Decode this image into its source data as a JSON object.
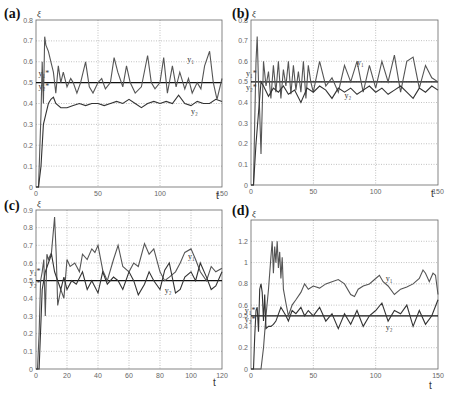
{
  "chart_data": [
    {
      "panel": "(a)",
      "type": "line",
      "title": "",
      "xlabel": "t",
      "ylabel": "ξ",
      "xlim": [
        0,
        150
      ],
      "ylim": [
        0,
        0.8
      ],
      "xticks": [
        "0",
        "50",
        "100",
        "150"
      ],
      "yticks": [
        "0",
        "0.1",
        "0.2",
        "0.3",
        "0.4",
        "0.5",
        "0.6",
        "0.7",
        "0.8"
      ],
      "grid": true,
      "reference_line": 0.5,
      "annotations": [
        "y1",
        "y2",
        "y1*",
        "y2*"
      ],
      "series": [
        {
          "name": "y1",
          "x": [
            0,
            2,
            4,
            5,
            6,
            7,
            8,
            10,
            12,
            14,
            16,
            18,
            20,
            22,
            25,
            28,
            30,
            33,
            36,
            40,
            43,
            46,
            50,
            53,
            56,
            60,
            63,
            66,
            70,
            73,
            76,
            80,
            85,
            90,
            93,
            96,
            100,
            103,
            106,
            110,
            113,
            116,
            120,
            123,
            126,
            130,
            133,
            136,
            140,
            143,
            146,
            150
          ],
          "values": [
            0,
            0,
            0.35,
            0.6,
            0.4,
            0.72,
            0.68,
            0.65,
            0.6,
            0.55,
            0.45,
            0.58,
            0.5,
            0.55,
            0.48,
            0.52,
            0.5,
            0.45,
            0.5,
            0.6,
            0.48,
            0.45,
            0.5,
            0.52,
            0.47,
            0.5,
            0.62,
            0.55,
            0.48,
            0.58,
            0.5,
            0.45,
            0.48,
            0.63,
            0.5,
            0.47,
            0.5,
            0.62,
            0.45,
            0.58,
            0.48,
            0.55,
            0.47,
            0.52,
            0.45,
            0.5,
            0.47,
            0.58,
            0.65,
            0.5,
            0.42,
            0.52
          ]
        },
        {
          "name": "y2",
          "x": [
            0,
            2,
            4,
            6,
            8,
            10,
            12,
            14,
            16,
            20,
            25,
            30,
            35,
            40,
            45,
            50,
            55,
            60,
            65,
            70,
            75,
            80,
            85,
            90,
            95,
            100,
            105,
            110,
            115,
            120,
            125,
            130,
            135,
            140,
            145,
            150
          ],
          "values": [
            0,
            0,
            0.1,
            0.3,
            0.35,
            0.4,
            0.42,
            0.43,
            0.4,
            0.38,
            0.38,
            0.39,
            0.4,
            0.39,
            0.4,
            0.4,
            0.39,
            0.4,
            0.41,
            0.4,
            0.42,
            0.4,
            0.38,
            0.4,
            0.41,
            0.4,
            0.41,
            0.4,
            0.44,
            0.4,
            0.39,
            0.41,
            0.4,
            0.4,
            0.42,
            0.41
          ]
        }
      ]
    },
    {
      "panel": "(b)",
      "type": "line",
      "title": "",
      "xlabel": "t",
      "ylabel": "ξ",
      "xlim": [
        0,
        150
      ],
      "ylim": [
        0,
        0.8
      ],
      "xticks": [
        "0",
        "50",
        "100",
        "150"
      ],
      "yticks": [
        "0",
        "0.1",
        "0.2",
        "0.3",
        "0.4",
        "0.5",
        "0.6",
        "0.7",
        "0.8"
      ],
      "grid": true,
      "reference_line": 0.5,
      "annotations": [
        "y1",
        "y2",
        "y1*",
        "y2*"
      ],
      "series": [
        {
          "name": "y1",
          "x": [
            0,
            2,
            3,
            4,
            5,
            6,
            7,
            8,
            10,
            12,
            14,
            16,
            18,
            20,
            22,
            24,
            26,
            28,
            30,
            32,
            34,
            36,
            38,
            40,
            42,
            44,
            46,
            48,
            50,
            55,
            60,
            65,
            70,
            75,
            80,
            85,
            90,
            95,
            100,
            105,
            110,
            115,
            120,
            125,
            130,
            135,
            140,
            145,
            150
          ],
          "values": [
            0,
            0,
            0.3,
            0.6,
            0.72,
            0.5,
            0.35,
            0.15,
            0.6,
            0.48,
            0.55,
            0.42,
            0.58,
            0.45,
            0.6,
            0.42,
            0.56,
            0.48,
            0.6,
            0.44,
            0.58,
            0.46,
            0.55,
            0.45,
            0.6,
            0.42,
            0.58,
            0.5,
            0.45,
            0.6,
            0.48,
            0.52,
            0.45,
            0.58,
            0.5,
            0.6,
            0.45,
            0.58,
            0.47,
            0.6,
            0.5,
            0.63,
            0.45,
            0.6,
            0.62,
            0.47,
            0.58,
            0.52,
            0.5
          ]
        },
        {
          "name": "y2",
          "x": [
            0,
            2,
            4,
            6,
            8,
            10,
            14,
            18,
            22,
            26,
            30,
            35,
            40,
            45,
            50,
            55,
            60,
            65,
            70,
            75,
            80,
            85,
            90,
            95,
            100,
            105,
            110,
            115,
            120,
            125,
            130,
            135,
            140,
            145,
            150
          ],
          "values": [
            0,
            0,
            0.2,
            0.35,
            0.5,
            0.48,
            0.43,
            0.47,
            0.45,
            0.48,
            0.44,
            0.46,
            0.4,
            0.47,
            0.45,
            0.48,
            0.46,
            0.42,
            0.47,
            0.45,
            0.47,
            0.44,
            0.46,
            0.48,
            0.45,
            0.47,
            0.44,
            0.46,
            0.48,
            0.45,
            0.42,
            0.47,
            0.45,
            0.48,
            0.46
          ]
        }
      ]
    },
    {
      "panel": "(c)",
      "type": "line",
      "title": "",
      "xlabel": "t",
      "ylabel": "ξ",
      "xlim": [
        0,
        120
      ],
      "ylim": [
        0,
        0.9
      ],
      "xticks": [
        "0",
        "20",
        "40",
        "60",
        "80",
        "100",
        "120"
      ],
      "yticks": [
        "0",
        "0.1",
        "0.2",
        "0.3",
        "0.4",
        "0.5",
        "0.6",
        "0.7",
        "0.8",
        "0.9"
      ],
      "grid": true,
      "reference_line": 0.5,
      "annotations": [
        "y1",
        "y2",
        "y1*",
        "y2*"
      ],
      "series": [
        {
          "name": "y1",
          "x": [
            0,
            1,
            2,
            3,
            4,
            5,
            6,
            7,
            8,
            10,
            12,
            13,
            14,
            16,
            18,
            20,
            22,
            25,
            28,
            30,
            33,
            36,
            38,
            40,
            43,
            46,
            50,
            53,
            56,
            60,
            63,
            66,
            70,
            73,
            76,
            80,
            83,
            86,
            90,
            93,
            96,
            100,
            103,
            106,
            110,
            113,
            116,
            120
          ],
          "values": [
            0,
            0,
            0.2,
            0.5,
            0.55,
            0.62,
            0.3,
            0.65,
            0.62,
            0.66,
            0.86,
            0.65,
            0.36,
            0.45,
            0.4,
            0.62,
            0.58,
            0.6,
            0.55,
            0.65,
            0.62,
            0.68,
            0.66,
            0.7,
            0.56,
            0.5,
            0.62,
            0.7,
            0.58,
            0.55,
            0.6,
            0.58,
            0.71,
            0.65,
            0.68,
            0.55,
            0.5,
            0.52,
            0.55,
            0.6,
            0.66,
            0.68,
            0.62,
            0.55,
            0.5,
            0.58,
            0.55,
            0.57
          ]
        },
        {
          "name": "y2",
          "x": [
            0,
            2,
            4,
            6,
            8,
            10,
            12,
            14,
            16,
            18,
            20,
            23,
            26,
            30,
            33,
            36,
            40,
            43,
            46,
            50,
            53,
            56,
            60,
            63,
            66,
            70,
            73,
            76,
            80,
            83,
            86,
            90,
            93,
            96,
            100,
            103,
            106,
            110,
            113,
            116,
            120
          ],
          "values": [
            0,
            0,
            0.45,
            0.55,
            0.6,
            0.65,
            0.55,
            0.5,
            0.45,
            0.52,
            0.45,
            0.5,
            0.48,
            0.55,
            0.45,
            0.5,
            0.43,
            0.55,
            0.48,
            0.52,
            0.5,
            0.45,
            0.55,
            0.5,
            0.42,
            0.48,
            0.55,
            0.5,
            0.45,
            0.56,
            0.6,
            0.43,
            0.45,
            0.52,
            0.55,
            0.5,
            0.6,
            0.52,
            0.45,
            0.47,
            0.55
          ]
        }
      ]
    },
    {
      "panel": "(d)",
      "type": "line",
      "title": "",
      "xlabel": "t",
      "ylabel": "ξ",
      "xlim": [
        0,
        150
      ],
      "ylim": [
        0,
        1.4
      ],
      "xticks": [
        "0",
        "50",
        "100",
        "150"
      ],
      "yticks": [
        "0",
        "0.2",
        "0.4",
        "0.5",
        "0.6",
        "0.8",
        "1",
        "1.2"
      ],
      "grid": true,
      "reference_line": 0.5,
      "annotations": [
        "y1",
        "y2",
        "y1*",
        "y2*"
      ],
      "series": [
        {
          "name": "y1",
          "x": [
            0,
            5,
            8,
            10,
            12,
            14,
            16,
            17,
            18,
            19,
            20,
            21,
            22,
            23,
            24,
            25,
            26,
            28,
            30,
            33,
            36,
            40,
            43,
            46,
            50,
            55,
            60,
            65,
            70,
            75,
            80,
            83,
            86,
            90,
            95,
            100,
            103,
            106,
            110,
            115,
            120,
            125,
            130,
            135,
            138,
            140,
            143,
            146,
            148,
            150
          ],
          "values": [
            0,
            0,
            0,
            0.2,
            0.5,
            0.75,
            1.05,
            1.2,
            0.9,
            1.15,
            1.0,
            1.2,
            0.95,
            1.1,
            0.85,
            1.05,
            0.75,
            0.62,
            0.5,
            0.6,
            0.65,
            0.72,
            0.8,
            0.75,
            0.78,
            0.76,
            0.8,
            0.82,
            0.84,
            0.8,
            0.7,
            0.68,
            0.75,
            0.78,
            0.8,
            0.85,
            0.88,
            0.82,
            0.78,
            0.7,
            0.75,
            0.77,
            0.8,
            0.85,
            0.93,
            0.9,
            0.82,
            0.9,
            0.88,
            0.7
          ]
        },
        {
          "name": "y2",
          "x": [
            0,
            2,
            3,
            4,
            5,
            6,
            7,
            8,
            9,
            10,
            11,
            12,
            14,
            16,
            18,
            20,
            24,
            28,
            30,
            33,
            36,
            40,
            43,
            46,
            50,
            55,
            60,
            65,
            70,
            75,
            80,
            85,
            90,
            95,
            100,
            105,
            110,
            115,
            120,
            125,
            130,
            135,
            140,
            145,
            150
          ],
          "values": [
            0,
            0,
            0.3,
            0.55,
            0.58,
            0.35,
            0.75,
            0.8,
            0.72,
            0.45,
            0.7,
            0.38,
            0.4,
            0.4,
            0.42,
            0.45,
            0.58,
            0.5,
            0.45,
            0.55,
            0.52,
            0.58,
            0.5,
            0.55,
            0.5,
            0.58,
            0.45,
            0.52,
            0.38,
            0.52,
            0.42,
            0.55,
            0.4,
            0.5,
            0.55,
            0.62,
            0.45,
            0.55,
            0.52,
            0.6,
            0.4,
            0.55,
            0.42,
            0.5,
            0.65
          ]
        }
      ]
    }
  ],
  "panels": [
    {
      "label": "(a)",
      "ylabel": "ξ",
      "xlabel": "t",
      "ann_y1": "y₁",
      "ann_y2": "y₂",
      "ann_y1s": "y₁*",
      "ann_y2s": "y₂*"
    },
    {
      "label": "(b)",
      "ylabel": "ξ",
      "xlabel": "t",
      "ann_y1": "y₁",
      "ann_y2": "y₂",
      "ann_y1s": "y₁*",
      "ann_y2s": "y₂*"
    },
    {
      "label": "(c)",
      "ylabel": "ξ",
      "xlabel": "t",
      "ann_y1": "y₁",
      "ann_y2": "y₂",
      "ann_y1s": "y₁*",
      "ann_y2s": "y₂*"
    },
    {
      "label": "(d)",
      "ylabel": "ξ",
      "xlabel": "t",
      "ann_y1": "y₁",
      "ann_y2": "y₂",
      "ann_y1s": "y₁*",
      "ann_y2s": "y₂*"
    }
  ]
}
